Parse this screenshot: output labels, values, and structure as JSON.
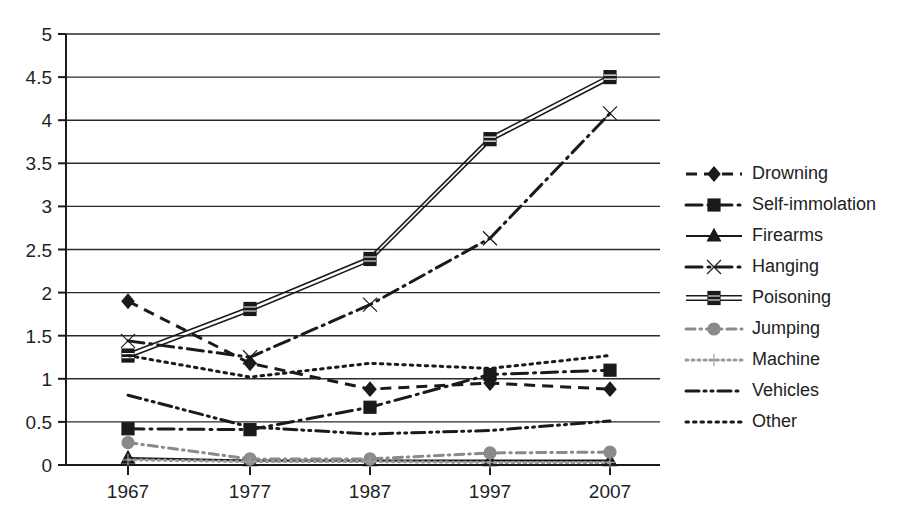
{
  "chart_data": {
    "type": "line",
    "title": "",
    "subtitle": "",
    "xlabel": "",
    "ylabel": "",
    "x": [
      1967,
      1977,
      1987,
      1997,
      2007
    ],
    "categories": [
      "1967",
      "1977",
      "1987",
      "1997",
      "2007"
    ],
    "xtick_labels": [
      "1967",
      "1977",
      "1987",
      "1997",
      "2007"
    ],
    "ytick_labels": [
      "0",
      "0.5",
      "1",
      "1.5",
      "2",
      "2.5",
      "3",
      "3.5",
      "4",
      "4.5",
      "5"
    ],
    "ytick_values": [
      0,
      0.5,
      1,
      1.5,
      2,
      2.5,
      3,
      3.5,
      4,
      4.5,
      5
    ],
    "ylim": [
      0,
      5
    ],
    "grid": "horizontal",
    "legend_position": "right",
    "series": [
      {
        "name": "Drowning",
        "marker": "diamond",
        "dash": "dashed",
        "color": "#1a1a1a",
        "values": [
          1.9,
          1.18,
          0.88,
          0.95,
          0.88
        ]
      },
      {
        "name": "Self-immolation",
        "marker": "square",
        "dash": "long-dash-dot",
        "color": "#1a1a1a",
        "values": [
          0.42,
          0.41,
          0.67,
          1.05,
          1.1
        ]
      },
      {
        "name": "Firearms",
        "marker": "triangle",
        "dash": "solid",
        "color": "#1a1a1a",
        "values": [
          0.08,
          0.05,
          0.05,
          0.05,
          0.05
        ]
      },
      {
        "name": "Hanging",
        "marker": "cross",
        "dash": "long-dash-dot",
        "color": "#1a1a1a",
        "values": [
          1.44,
          1.25,
          1.86,
          2.63,
          4.08
        ]
      },
      {
        "name": "Poisoning",
        "marker": "square-double",
        "dash": "double-solid",
        "color": "#1a1a1a",
        "values": [
          1.27,
          1.81,
          2.39,
          3.78,
          4.5
        ]
      },
      {
        "name": "Jumping",
        "marker": "circle",
        "dash": "dash-dot",
        "color": "#8a8a8a",
        "values": [
          0.26,
          0.07,
          0.07,
          0.14,
          0.15
        ]
      },
      {
        "name": "Machine",
        "marker": "plus",
        "dash": "dotted",
        "color": "#9a9a9a",
        "values": [
          0.06,
          0.04,
          0.04,
          0.03,
          0.03
        ]
      },
      {
        "name": "Vehicles",
        "marker": "none",
        "dash": "dash-dot-dot",
        "color": "#1a1a1a",
        "values": [
          0.81,
          0.44,
          0.36,
          0.4,
          0.51
        ]
      },
      {
        "name": "Other",
        "marker": "none",
        "dash": "dotted-fine",
        "color": "#1a1a1a",
        "values": [
          1.27,
          1.02,
          1.18,
          1.12,
          1.27
        ]
      }
    ]
  },
  "legend": {
    "items": [
      {
        "label": "Drowning"
      },
      {
        "label": "Self-immolation"
      },
      {
        "label": "Firearms"
      },
      {
        "label": "Hanging"
      },
      {
        "label": "Poisoning"
      },
      {
        "label": "Jumping"
      },
      {
        "label": "Machine"
      },
      {
        "label": "Vehicles"
      },
      {
        "label": "Other"
      }
    ]
  }
}
